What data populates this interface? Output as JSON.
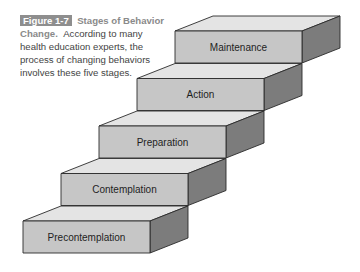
{
  "caption": {
    "figure_label": "Figure 1-7",
    "title": "Stages of Behavior Change.",
    "text": "According to many health education experts, the process of changing behaviors involves these five stages."
  },
  "steps": [
    {
      "label": "Precontemplation",
      "order": 1
    },
    {
      "label": "Contemplation",
      "order": 2
    },
    {
      "label": "Preparation",
      "order": 3
    },
    {
      "label": "Action",
      "order": 4
    },
    {
      "label": "Maintenance",
      "order": 5
    }
  ],
  "colors": {
    "top_face": "#e4e4e4",
    "front_face": "#c6c6c6",
    "side_face": "#7c7c7c",
    "edge": "#2a2a2a",
    "badge": "#8e8e8e"
  }
}
